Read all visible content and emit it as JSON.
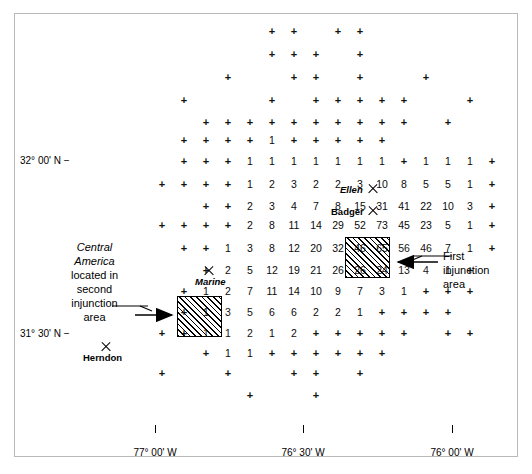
{
  "figure": {
    "type": "map"
  },
  "axes": {
    "latitude_labels": [
      {
        "text": "32° 00' N −",
        "x": 20,
        "y": 155
      },
      {
        "text": "31° 30' N −",
        "x": 20,
        "y": 328
      }
    ],
    "longitude_labels": [
      {
        "text": "77° 00' W",
        "x": 155,
        "y": 447,
        "tick_x": 155,
        "tick_y": 425
      },
      {
        "text": "76° 30' W",
        "x": 303,
        "y": 447,
        "tick_x": 303,
        "tick_y": 425
      },
      {
        "text": "76° 00' W",
        "x": 452,
        "y": 447,
        "tick_x": 452,
        "tick_y": 425
      }
    ]
  },
  "sites": [
    {
      "name": "Ellen",
      "style": "italic",
      "marker_x": 373,
      "marker_y": 189,
      "label_x": 340,
      "label_y": 184
    },
    {
      "name": "Badger",
      "style": "bold",
      "marker_x": 373,
      "marker_y": 211,
      "label_x": 331,
      "label_y": 206
    },
    {
      "name": "Marine",
      "style": "italic",
      "marker_x": 209,
      "marker_y": 271,
      "label_x": 195,
      "label_y": 276
    },
    {
      "name": "Herndon",
      "style": "bold",
      "marker_x": 106,
      "marker_y": 347,
      "label_x": 83,
      "label_y": 352
    }
  ],
  "annotations": [
    {
      "id": "second-injunction-note",
      "lines": [
        "Central",
        "America",
        "located in",
        "second",
        "injunction",
        "area"
      ],
      "italic_lines": [
        0,
        1
      ],
      "x": 47,
      "y": 240,
      "width": 95
    },
    {
      "id": "first-injunction-note",
      "lines": [
        "First",
        "injunction",
        "area"
      ],
      "italic_lines": [],
      "x": 443,
      "y": 249,
      "width": 80
    }
  ],
  "injunction_boxes": [
    {
      "id": "first-injunction-area",
      "label": "First injunction area",
      "x": 345,
      "y": 237,
      "width": 45,
      "height": 41,
      "cell_values": [
        [
          "56",
          "46"
        ],
        [
          "13",
          "4"
        ]
      ]
    },
    {
      "id": "second-injunction-area",
      "label": "Second injunction area",
      "x": 177,
      "y": 296,
      "width": 45,
      "height": 41,
      "cell_values": [
        [
          "3",
          "5"
        ],
        [
          "1",
          "2"
        ]
      ]
    }
  ],
  "chart_data": {
    "type": "heatmap",
    "title": "",
    "xlabel": "Longitude",
    "ylabel": "Latitude",
    "grid": false,
    "legend": "none",
    "col_x": [
      52,
      74,
      96,
      118,
      140,
      162,
      184,
      206,
      228,
      250,
      272,
      294,
      316,
      338,
      360,
      382,
      404,
      426,
      448,
      470,
      492
    ],
    "row_y": [
      31,
      54,
      77,
      100,
      122,
      140,
      161,
      184,
      206,
      225,
      248,
      270,
      291,
      312,
      333,
      353,
      373,
      395,
      415
    ],
    "rows": [
      {
        "y": 31,
        "cells": [
          {
            "c": 10,
            "v": "+"
          },
          {
            "c": 11,
            "v": "+"
          },
          {
            "c": 13,
            "v": "+"
          },
          {
            "c": 14,
            "v": "+"
          }
        ]
      },
      {
        "y": 54,
        "cells": [
          {
            "c": 10,
            "v": "+"
          },
          {
            "c": 11,
            "v": "+"
          },
          {
            "c": 12,
            "v": "+"
          },
          {
            "c": 14,
            "v": "+"
          }
        ]
      },
      {
        "y": 77,
        "cells": [
          {
            "c": 8,
            "v": "+"
          },
          {
            "c": 11,
            "v": "+"
          },
          {
            "c": 12,
            "v": "+"
          },
          {
            "c": 14,
            "v": "+"
          },
          {
            "c": 17,
            "v": "+"
          }
        ]
      },
      {
        "y": 100,
        "cells": [
          {
            "c": 6,
            "v": "+"
          },
          {
            "c": 10,
            "v": "+"
          },
          {
            "c": 12,
            "v": "+"
          },
          {
            "c": 13,
            "v": "+"
          },
          {
            "c": 14,
            "v": "+"
          },
          {
            "c": 15,
            "v": "+"
          },
          {
            "c": 16,
            "v": "+"
          },
          {
            "c": 19,
            "v": "+"
          }
        ]
      },
      {
        "y": 122,
        "cells": [
          {
            "c": 7,
            "v": "+"
          },
          {
            "c": 8,
            "v": "+"
          },
          {
            "c": 9,
            "v": "+"
          },
          {
            "c": 10,
            "v": "+"
          },
          {
            "c": 11,
            "v": "+"
          },
          {
            "c": 12,
            "v": "+"
          },
          {
            "c": 13,
            "v": "+"
          },
          {
            "c": 14,
            "v": "+"
          },
          {
            "c": 15,
            "v": "+"
          },
          {
            "c": 16,
            "v": "+"
          },
          {
            "c": 18,
            "v": "+"
          }
        ]
      },
      {
        "y": 140,
        "cells": [
          {
            "c": 6,
            "v": "+"
          },
          {
            "c": 7,
            "v": "+"
          },
          {
            "c": 8,
            "v": "+"
          },
          {
            "c": 9,
            "v": "+"
          },
          {
            "c": 10,
            "v": "1"
          },
          {
            "c": 11,
            "v": "+"
          },
          {
            "c": 12,
            "v": "+"
          },
          {
            "c": 13,
            "v": "+"
          },
          {
            "c": 14,
            "v": "+"
          },
          {
            "c": 15,
            "v": "+"
          }
        ]
      },
      {
        "y": 161,
        "cells": [
          {
            "c": 6,
            "v": "+"
          },
          {
            "c": 7,
            "v": "+"
          },
          {
            "c": 8,
            "v": "+"
          },
          {
            "c": 9,
            "v": "1"
          },
          {
            "c": 10,
            "v": "1"
          },
          {
            "c": 11,
            "v": "1"
          },
          {
            "c": 12,
            "v": "1"
          },
          {
            "c": 13,
            "v": "1"
          },
          {
            "c": 14,
            "v": "1"
          },
          {
            "c": 15,
            "v": "1"
          },
          {
            "c": 16,
            "v": "+"
          },
          {
            "c": 17,
            "v": "1"
          },
          {
            "c": 18,
            "v": "1"
          },
          {
            "c": 19,
            "v": "1"
          },
          {
            "c": 20,
            "v": "+"
          }
        ]
      },
      {
        "y": 184,
        "cells": [
          {
            "c": 5,
            "v": "+"
          },
          {
            "c": 6,
            "v": "+"
          },
          {
            "c": 7,
            "v": "+"
          },
          {
            "c": 8,
            "v": "+"
          },
          {
            "c": 9,
            "v": "1"
          },
          {
            "c": 10,
            "v": "2"
          },
          {
            "c": 11,
            "v": "3"
          },
          {
            "c": 12,
            "v": "2"
          },
          {
            "c": 13,
            "v": "2"
          },
          {
            "c": 14,
            "v": "3"
          },
          {
            "c": 15,
            "v": "10"
          },
          {
            "c": 16,
            "v": "8"
          },
          {
            "c": 17,
            "v": "5"
          },
          {
            "c": 18,
            "v": "5"
          },
          {
            "c": 19,
            "v": "1"
          },
          {
            "c": 20,
            "v": "+"
          }
        ]
      },
      {
        "y": 206,
        "cells": [
          {
            "c": 7,
            "v": "+"
          },
          {
            "c": 8,
            "v": "+"
          },
          {
            "c": 9,
            "v": "2"
          },
          {
            "c": 10,
            "v": "3"
          },
          {
            "c": 11,
            "v": "4"
          },
          {
            "c": 12,
            "v": "7"
          },
          {
            "c": 13,
            "v": "8"
          },
          {
            "c": 14,
            "v": "15"
          },
          {
            "c": 15,
            "v": "31"
          },
          {
            "c": 16,
            "v": "41"
          },
          {
            "c": 17,
            "v": "22"
          },
          {
            "c": 18,
            "v": "10"
          },
          {
            "c": 19,
            "v": "3"
          },
          {
            "c": 20,
            "v": "+"
          }
        ]
      },
      {
        "y": 225,
        "cells": [
          {
            "c": 5,
            "v": "+"
          },
          {
            "c": 6,
            "v": "+"
          },
          {
            "c": 7,
            "v": "+"
          },
          {
            "c": 8,
            "v": "+"
          },
          {
            "c": 9,
            "v": "2"
          },
          {
            "c": 10,
            "v": "8"
          },
          {
            "c": 11,
            "v": "11"
          },
          {
            "c": 12,
            "v": "14"
          },
          {
            "c": 13,
            "v": "29"
          },
          {
            "c": 14,
            "v": "52"
          },
          {
            "c": 15,
            "v": "73"
          },
          {
            "c": 16,
            "v": "45"
          },
          {
            "c": 17,
            "v": "23"
          },
          {
            "c": 18,
            "v": "5"
          },
          {
            "c": 19,
            "v": "1"
          },
          {
            "c": 20,
            "v": "+"
          }
        ]
      },
      {
        "y": 248,
        "cells": [
          {
            "c": 6,
            "v": "+"
          },
          {
            "c": 7,
            "v": "+"
          },
          {
            "c": 8,
            "v": "1"
          },
          {
            "c": 9,
            "v": "3"
          },
          {
            "c": 10,
            "v": "8"
          },
          {
            "c": 11,
            "v": "12"
          },
          {
            "c": 12,
            "v": "20"
          },
          {
            "c": 13,
            "v": "32"
          },
          {
            "c": 14,
            "v": "46"
          },
          {
            "c": 15,
            "v": "65"
          },
          {
            "c": 16,
            "v": "56",
            "boxed": true
          },
          {
            "c": 17,
            "v": "46",
            "boxed": true
          },
          {
            "c": 18,
            "v": "7"
          },
          {
            "c": 19,
            "v": "1"
          },
          {
            "c": 20,
            "v": "+"
          }
        ]
      },
      {
        "y": 270,
        "cells": [
          {
            "c": 7,
            "v": "+"
          },
          {
            "c": 8,
            "v": "2"
          },
          {
            "c": 9,
            "v": "5"
          },
          {
            "c": 10,
            "v": "12"
          },
          {
            "c": 11,
            "v": "19"
          },
          {
            "c": 12,
            "v": "21"
          },
          {
            "c": 13,
            "v": "26"
          },
          {
            "c": 14,
            "v": "26"
          },
          {
            "c": 15,
            "v": "24"
          },
          {
            "c": 16,
            "v": "13",
            "boxed": true
          },
          {
            "c": 17,
            "v": "4",
            "boxed": true
          },
          {
            "c": 18,
            "v": "1"
          },
          {
            "c": 19,
            "v": "+"
          }
        ]
      },
      {
        "y": 291,
        "cells": [
          {
            "c": 6,
            "v": "+"
          },
          {
            "c": 7,
            "v": "1"
          },
          {
            "c": 8,
            "v": "2"
          },
          {
            "c": 9,
            "v": "7"
          },
          {
            "c": 10,
            "v": "11"
          },
          {
            "c": 11,
            "v": "14"
          },
          {
            "c": 12,
            "v": "10"
          },
          {
            "c": 13,
            "v": "9"
          },
          {
            "c": 14,
            "v": "7"
          },
          {
            "c": 15,
            "v": "3"
          },
          {
            "c": 16,
            "v": "1"
          },
          {
            "c": 17,
            "v": "+"
          },
          {
            "c": 18,
            "v": "+"
          },
          {
            "c": 19,
            "v": "+"
          }
        ]
      },
      {
        "y": 312,
        "cells": [
          {
            "c": 6,
            "v": "+"
          },
          {
            "c": 7,
            "v": "1"
          },
          {
            "c": 8,
            "v": "3",
            "boxed": true
          },
          {
            "c": 9,
            "v": "5",
            "boxed": true
          },
          {
            "c": 10,
            "v": "6"
          },
          {
            "c": 11,
            "v": "6"
          },
          {
            "c": 12,
            "v": "2"
          },
          {
            "c": 13,
            "v": "2"
          },
          {
            "c": 14,
            "v": "1"
          },
          {
            "c": 15,
            "v": "+"
          },
          {
            "c": 16,
            "v": "+"
          },
          {
            "c": 17,
            "v": "+"
          },
          {
            "c": 18,
            "v": "+"
          }
        ]
      },
      {
        "y": 333,
        "cells": [
          {
            "c": 5,
            "v": "+"
          },
          {
            "c": 6,
            "v": "+"
          },
          {
            "c": 7,
            "v": "1"
          },
          {
            "c": 8,
            "v": "1",
            "boxed": true
          },
          {
            "c": 9,
            "v": "2",
            "boxed": true
          },
          {
            "c": 10,
            "v": "1"
          },
          {
            "c": 11,
            "v": "2"
          },
          {
            "c": 12,
            "v": "+"
          },
          {
            "c": 13,
            "v": "+"
          },
          {
            "c": 14,
            "v": "+"
          },
          {
            "c": 15,
            "v": "+"
          },
          {
            "c": 16,
            "v": "+"
          },
          {
            "c": 18,
            "v": "+"
          },
          {
            "c": 19,
            "v": "+"
          }
        ]
      },
      {
        "y": 353,
        "cells": [
          {
            "c": 7,
            "v": "+"
          },
          {
            "c": 8,
            "v": "1"
          },
          {
            "c": 9,
            "v": "1"
          },
          {
            "c": 10,
            "v": "+"
          },
          {
            "c": 11,
            "v": "+"
          },
          {
            "c": 12,
            "v": "+"
          },
          {
            "c": 13,
            "v": "+"
          },
          {
            "c": 14,
            "v": "+"
          },
          {
            "c": 15,
            "v": "+"
          }
        ]
      },
      {
        "y": 373,
        "cells": [
          {
            "c": 5,
            "v": "+"
          },
          {
            "c": 8,
            "v": "+"
          },
          {
            "c": 11,
            "v": "+"
          },
          {
            "c": 12,
            "v": "+"
          },
          {
            "c": 14,
            "v": "+"
          }
        ]
      },
      {
        "y": 395,
        "cells": [
          {
            "c": 9,
            "v": "+"
          },
          {
            "c": 12,
            "v": "+"
          }
        ]
      }
    ]
  }
}
